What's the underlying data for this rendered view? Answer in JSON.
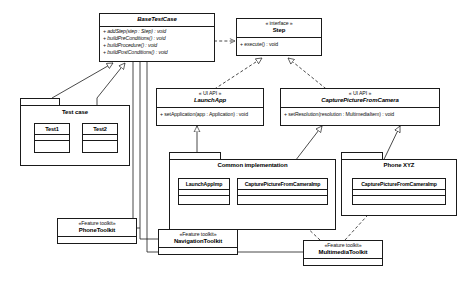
{
  "diagram": {
    "type": "uml-class-diagram",
    "background": "#ffffff",
    "line_color": "#1a1a1a"
  },
  "base_test_case": {
    "name": "BaseTestCase",
    "abstract": true,
    "operations": [
      "+ addStep(step : Step) : void",
      "+ buildPreConditions() : void",
      "+ buildProcedure() : void",
      "+ buildPostConditions() : void"
    ]
  },
  "step_interface": {
    "stereotype": "« interface »",
    "name": "Step",
    "operations": [
      "+ execute() : void"
    ]
  },
  "launch_app": {
    "stereotype": "« UI API »",
    "name": "LaunchApp",
    "operations": [
      "+ setApplication(app : Application) : void"
    ]
  },
  "capture_picture": {
    "stereotype": "« UI API »",
    "name": "CapturePictureFromCamera",
    "operations": [
      "+ setResolution(resolution : MultimediaItem) : void"
    ]
  },
  "test_case_package": {
    "name": "Test case",
    "classes": [
      {
        "name": "Test1"
      },
      {
        "name": "Test2"
      }
    ]
  },
  "common_implementation_package": {
    "name": "Common implementation",
    "classes": [
      {
        "name": "LaunchAppImp"
      },
      {
        "name": "CapturePictureFromCameraImp"
      }
    ]
  },
  "phone_package": {
    "name": "Phone XYZ",
    "classes": [
      {
        "name": "CapturePictureFromCameraImp"
      }
    ]
  },
  "phone_toolkit": {
    "stereotype": "«Feature toolkit»",
    "name": "PhoneToolkit"
  },
  "navigation_toolkit": {
    "stereotype": "«Feature toolkit»",
    "name": "NavigationToolkit"
  },
  "multimedia_toolkit": {
    "stereotype": "«Feature toolkit»",
    "name": "MultimediaToolkit"
  }
}
